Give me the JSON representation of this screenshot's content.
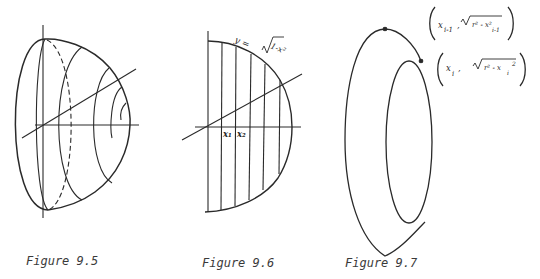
{
  "figures": [
    {
      "id": "fig-9-5",
      "caption": "Figure 9.5",
      "description": "Half-ellipsoid solid of revolution with cross-sectional circles (one dashed) and coordinate axes"
    },
    {
      "id": "fig-9-6",
      "caption": "Figure 9.6",
      "curve_label": "y = √(1 - x²)",
      "curve_label_prefix": "y =",
      "curve_label_radicand": "1-x²",
      "partition_labels": [
        "x₁",
        "x₂"
      ],
      "description": "Semicircle region partitioned by vertical lines with axes"
    },
    {
      "id": "fig-9-7",
      "caption": "Figure 9.7",
      "point_labels": [
        {
          "x": "x",
          "x_sub": "i-1",
          "radicand": "r² - x²",
          "radicand_sub": "i-1"
        },
        {
          "x": "x",
          "x_sub": "i",
          "radicand": "r² - x",
          "radicand_sub": "i",
          "radicand_sup": "2"
        }
      ],
      "description": "Frustum-like band between two consecutive circular cross-sections"
    }
  ],
  "colors": {
    "ink": "#2a2a2a",
    "background": "#ffffff"
  }
}
